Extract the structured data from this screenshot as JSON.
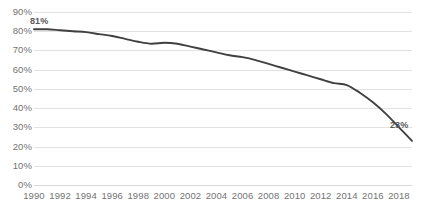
{
  "chart_data": {
    "type": "line",
    "title": "",
    "subtitle": "",
    "xlabel": "",
    "ylabel": "",
    "grid": true,
    "legend": "none",
    "line_color": "#404040",
    "gridline_color": "#e2e2e2",
    "tick_label_color": "#737373",
    "xlim": [
      1990,
      2019
    ],
    "ylim": [
      0,
      90
    ],
    "y_tick_labels": [
      "90%",
      "80%",
      "70%",
      "60%",
      "50%",
      "40%",
      "30%",
      "20%",
      "10%",
      "0%"
    ],
    "y_tick_values": [
      90,
      80,
      70,
      60,
      50,
      40,
      30,
      20,
      10,
      0
    ],
    "x_tick_labels": [
      "1990",
      "1992",
      "1994",
      "1996",
      "1998",
      "2000",
      "2002",
      "2004",
      "2006",
      "2008",
      "2010",
      "2012",
      "2014",
      "2016",
      "2018"
    ],
    "x_tick_values": [
      1990,
      1992,
      1994,
      1996,
      1998,
      2000,
      2002,
      2004,
      2006,
      2008,
      2010,
      2012,
      2014,
      2016,
      2018
    ],
    "series": [
      {
        "name": "series-1",
        "x": [
          1990,
          1991,
          1992,
          1993,
          1994,
          1995,
          1996,
          1997,
          1998,
          1999,
          2000,
          2001,
          2002,
          2003,
          2004,
          2005,
          2006,
          2007,
          2008,
          2009,
          2010,
          2011,
          2012,
          2013,
          2014,
          2015,
          2016,
          2017,
          2018,
          2019
        ],
        "values": [
          81,
          81,
          80.5,
          80,
          79.5,
          78.5,
          77.5,
          76,
          74.5,
          73.5,
          74,
          73.5,
          72,
          70.5,
          69,
          67.5,
          66.5,
          65,
          63,
          61,
          59,
          57,
          55,
          53,
          52,
          48,
          43,
          37,
          30,
          23
        ]
      }
    ],
    "annotations": [
      {
        "label": "81%",
        "x": 1990,
        "y": 81,
        "position": "above"
      },
      {
        "label": "23%",
        "x": 2019,
        "y": 23,
        "position": "above-left"
      }
    ]
  }
}
